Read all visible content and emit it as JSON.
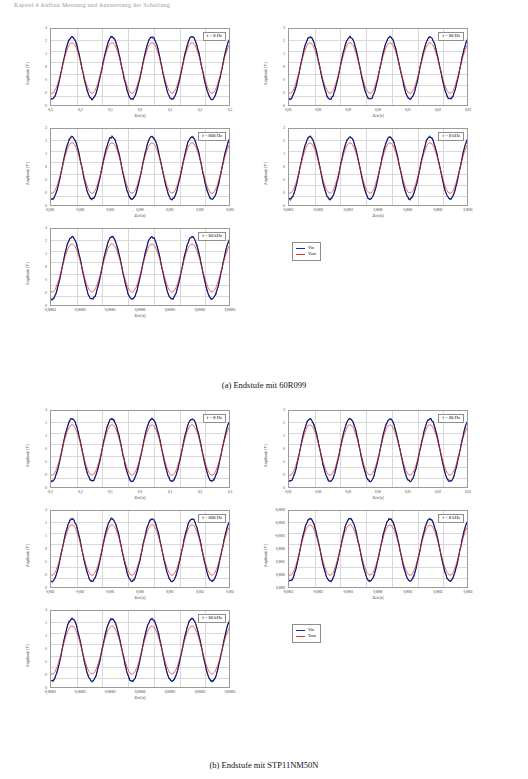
{
  "running_head": "Kapitel 4  Aufbau  Messung  und  Auswertung  der  Schaltung",
  "figures": [
    {
      "caption": "(a) Endstufe mit 60R099",
      "legend": {
        "items": [
          {
            "label": "Vin",
            "color": "#1c1cc8"
          },
          {
            "label": "Vout",
            "color": "#e03020"
          }
        ]
      },
      "panels": [
        {
          "badge": "f = 8 Hz",
          "ylabel": "Amplitude [V]",
          "xlabel": "Zeit [s]",
          "yticks": [
            "3",
            "2",
            "1",
            "0",
            "-1",
            "-2",
            "-3"
          ],
          "xticks": [
            "-0,3",
            "-0,2",
            "-0,1",
            "0,0",
            "0,1",
            "0,2",
            "0,3"
          ]
        },
        {
          "badge": "f = 80 Hz",
          "ylabel": "Amplitude [V]",
          "xlabel": "Zeit [s]",
          "yticks": [
            "3",
            "2",
            "1",
            "0",
            "-1",
            "-2",
            "-3"
          ],
          "xticks": [
            "-0,03",
            "-0,02",
            "-0,01",
            "0,00",
            "0,01",
            "0,02",
            "0,03"
          ]
        },
        {
          "badge": "f = 800 Hz",
          "ylabel": "Amplitude [V]",
          "xlabel": "Zeit [s]",
          "yticks": [
            "3",
            "2",
            "1",
            "0",
            "-1",
            "-2",
            "-3"
          ],
          "xticks": [
            "-0,003",
            "-0,002",
            "-0,001",
            "0,000",
            "0,001",
            "0,002",
            "0,003"
          ]
        },
        {
          "badge": "f = 8 kHz",
          "ylabel": "Amplitude [V]",
          "xlabel": "Zeit [s]",
          "yticks": [
            "3",
            "2",
            "1",
            "0",
            "-1",
            "-2",
            "-3"
          ],
          "xticks": [
            "-0,0003",
            "-0,0002",
            "-0,0001",
            "0,0000",
            "0,0001",
            "0,0002",
            "0,0003"
          ]
        },
        {
          "badge": "f = 80 kHz",
          "ylabel": "Amplitude [V]",
          "xlabel": "Zeit [s]",
          "yticks": [
            "3",
            "2",
            "1",
            "0",
            "-1",
            "-2",
            "-3"
          ],
          "xticks": [
            "-0,00003",
            "-0,00002",
            "-0,00001",
            "0,00000",
            "0,00001",
            "0,00002",
            "0,00003"
          ]
        }
      ]
    },
    {
      "caption": "(b) Endstufe mit STP11NM50N",
      "legend": {
        "items": [
          {
            "label": "Vin",
            "color": "#1c1cc8"
          },
          {
            "label": "Vout",
            "color": "#e03020"
          }
        ]
      },
      "panels": [
        {
          "badge": "f = 8 Hz",
          "ylabel": "Amplitude [V]",
          "xlabel": "Zeit [s]",
          "yticks": [
            "3",
            "2",
            "1",
            "0",
            "-1",
            "-2",
            "-3"
          ],
          "xticks": [
            "-0,3",
            "-0,2",
            "-0,1",
            "0,0",
            "0,1",
            "0,2",
            "0,3"
          ]
        },
        {
          "badge": "f = 80 Hz",
          "ylabel": "Amplitude [V]",
          "xlabel": "Zeit [s]",
          "yticks": [
            "3",
            "2",
            "1",
            "0",
            "-1",
            "-2",
            "-3"
          ],
          "xticks": [
            "-0,03",
            "-0,02",
            "-0,01",
            "0,00",
            "0,01",
            "0,02",
            "0,03"
          ]
        },
        {
          "badge": "f = 800 Hz",
          "ylabel": "Amplitude [V]",
          "xlabel": "Zeit [s]",
          "yticks": [
            "3",
            "2",
            "1",
            "0",
            "-1",
            "-2",
            "-3"
          ],
          "xticks": [
            "-0,003",
            "-0,002",
            "-0,001",
            "0,000",
            "0,001",
            "0,002",
            "0,003"
          ]
        },
        {
          "badge": "f = 8 kHz",
          "ylabel": "Amplitude [V]",
          "xlabel": "Zeit [s]",
          "yticks": [
            "-0,0003",
            "-0,0002",
            "-0,0001",
            "0,0000",
            "0,0001",
            "0,0002",
            "0,0003"
          ],
          "yticks_v": [
            "3",
            "2",
            "1",
            "0",
            "-1",
            "-2",
            "-3"
          ],
          "xticks": [
            "-0,0003",
            "-0,0002",
            "-0,0001",
            "0,0000",
            "0,0001",
            "0,0002",
            "0,0003"
          ]
        },
        {
          "badge": "f = 80 kHz",
          "ylabel": "Amplitude [V]",
          "xlabel": "Zeit [s]",
          "yticks": [
            "3",
            "2",
            "1",
            "0",
            "-1",
            "-2",
            "-3"
          ],
          "xticks": [
            "-0,00003",
            "-0,00002",
            "-0,00001",
            "0,00000",
            "0,00001",
            "0,00002",
            "0,00003"
          ]
        }
      ]
    }
  ],
  "chart_data": {
    "type": "line",
    "xlabel": "Zeit [s]",
    "ylabel": "Amplitude [V]",
    "ylim": [
      -3,
      3
    ],
    "grid": true,
    "legend_position": "center-right",
    "series": [
      {
        "name": "Vin",
        "color": "#1c1cc8",
        "waveform": "sine",
        "amplitude": 2.6,
        "cycles": 4.5
      },
      {
        "name": "Vout",
        "color": "#e03020",
        "waveform": "sine",
        "amplitude": 2.1,
        "cycles": 4.5
      }
    ],
    "subplots": [
      {
        "figure": "a",
        "badge": "f = 8 Hz",
        "xlim": [
          -0.3,
          0.3
        ],
        "vin_amp": 2.6,
        "vout_amp": 2.1
      },
      {
        "figure": "a",
        "badge": "f = 80 Hz",
        "xlim": [
          -0.03,
          0.03
        ],
        "vin_amp": 2.6,
        "vout_amp": 2.1
      },
      {
        "figure": "a",
        "badge": "f = 800 Hz",
        "xlim": [
          -0.003,
          0.003
        ],
        "vin_amp": 2.6,
        "vout_amp": 2.1
      },
      {
        "figure": "a",
        "badge": "f = 8 kHz",
        "xlim": [
          -0.0003,
          0.0003
        ],
        "vin_amp": 2.6,
        "vout_amp": 2.1
      },
      {
        "figure": "a",
        "badge": "f = 80 kHz",
        "xlim": [
          -3e-05,
          3e-05
        ],
        "vin_amp": 2.6,
        "vout_amp": 2.0
      },
      {
        "figure": "b",
        "badge": "f = 8 Hz",
        "xlim": [
          -0.3,
          0.3
        ],
        "vin_amp": 2.6,
        "vout_amp": 2.1
      },
      {
        "figure": "b",
        "badge": "f = 80 Hz",
        "xlim": [
          -0.03,
          0.03
        ],
        "vin_amp": 2.6,
        "vout_amp": 2.1
      },
      {
        "figure": "b",
        "badge": "f = 800 Hz",
        "xlim": [
          -0.003,
          0.003
        ],
        "vin_amp": 2.6,
        "vout_amp": 2.1
      },
      {
        "figure": "b",
        "badge": "f = 8 kHz",
        "xlim": [
          -0.0003,
          0.0003
        ],
        "vin_amp": 2.6,
        "vout_amp": 2.1
      },
      {
        "figure": "b",
        "badge": "f = 80 kHz",
        "xlim": [
          -3e-05,
          3e-05
        ],
        "vin_amp": 2.6,
        "vout_amp": 2.0
      }
    ]
  }
}
